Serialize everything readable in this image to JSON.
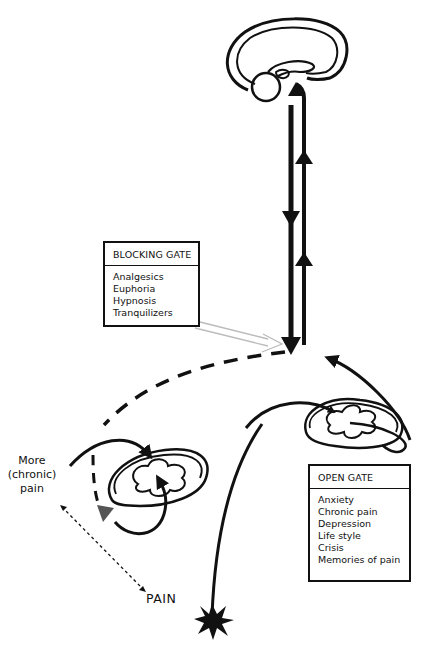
{
  "figure": {
    "colors": {
      "ink": "#111111",
      "background": "#ffffff",
      "light_arrow": "#bbbbbb"
    }
  },
  "blocking_gate": {
    "title": "BLOCKING GATE",
    "items": [
      "Analgesics",
      "Euphoria",
      "Hypnosis",
      "Tranquilizers"
    ]
  },
  "open_gate": {
    "title": "OPEN GATE",
    "items": [
      "Anxiety",
      "Chronic pain",
      "Depression",
      "Life style",
      "Crisis",
      "Memories of pain"
    ]
  },
  "labels": {
    "more_chronic_pain": [
      "More",
      "(chronic)",
      "pain"
    ],
    "pain": "PAIN"
  },
  "icons": {
    "brain": "brain-sagittal-icon",
    "spinal_cord": "spinal-cord-section-icon",
    "pain_burst": "starburst-icon"
  }
}
